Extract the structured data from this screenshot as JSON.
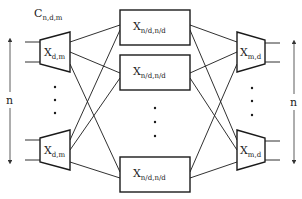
{
  "title": {
    "main": "C",
    "sub": "n,d,m"
  },
  "left_stage": {
    "switches": [
      {
        "main": "X",
        "sub": "d,m"
      },
      {
        "main": "X",
        "sub": "d,m"
      }
    ],
    "size_label": "n"
  },
  "middle_stage": {
    "switches": [
      {
        "main": "X",
        "sub": "n/d,n/d"
      },
      {
        "main": "X",
        "sub": "n/d,n/d"
      },
      {
        "main": "X",
        "sub": "n/d,n/d"
      }
    ]
  },
  "right_stage": {
    "switches": [
      {
        "main": "X",
        "sub": "m,d"
      },
      {
        "main": "X",
        "sub": "m,d"
      }
    ],
    "size_label": "n"
  },
  "colors": {
    "ink": "#1a1a1a",
    "background": "#ffffff"
  }
}
